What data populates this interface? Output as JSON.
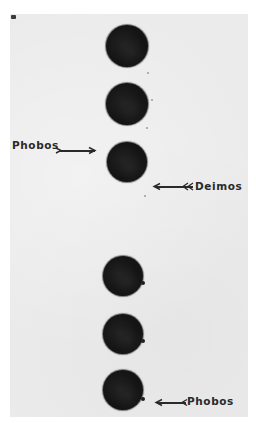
{
  "figure": {
    "colors": {
      "page_background": "#ffffff",
      "plate_background": "#ebebeb",
      "disc_color": "#141414",
      "label_color": "#2a2a2a"
    },
    "discs": [
      {
        "index": 1,
        "cx": 127,
        "cy": 46,
        "r": 21
      },
      {
        "index": 2,
        "cx": 127,
        "cy": 104,
        "r": 21
      },
      {
        "index": 3,
        "cx": 127,
        "cy": 162,
        "r": 20
      },
      {
        "index": 4,
        "cx": 123,
        "cy": 276,
        "r": 20
      },
      {
        "index": 5,
        "cx": 123,
        "cy": 334,
        "r": 20
      },
      {
        "index": 6,
        "cx": 123,
        "cy": 390,
        "r": 20
      }
    ],
    "labels": {
      "phobos_upper": "Phobos",
      "deimos": "Deimos",
      "phobos_lower": "Phobos"
    }
  }
}
